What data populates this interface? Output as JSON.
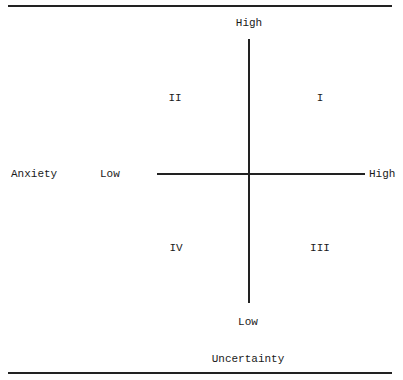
{
  "diagram": {
    "type": "quadrant",
    "vertical_axis": {
      "top_label": "High",
      "bottom_label": "Low",
      "title": "Uncertainty"
    },
    "horizontal_axis": {
      "left_label": "Low",
      "right_label": "High",
      "title": "Anxiety"
    },
    "quadrants": {
      "top_right": "I",
      "top_left": "II",
      "bottom_right": "III",
      "bottom_left": "IV"
    }
  }
}
